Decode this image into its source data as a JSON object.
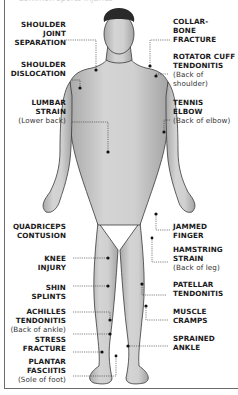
{
  "caption": "Common sports injuries",
  "colors": {
    "skin": "#c8c8c8",
    "skin_shade": "#9a9a9a",
    "hair": "#2a2a2a",
    "outline": "#3a3a3a",
    "marker": "#111111",
    "leader": "#333333",
    "frame": "#6b6b6b"
  },
  "labels": {
    "left": [
      {
        "title_lines": [
          "SHOULDER",
          "JOINT",
          "SEPARATION"
        ],
        "sub": ""
      },
      {
        "title_lines": [
          "SHOULDER",
          "DISLOCATION"
        ],
        "sub": ""
      },
      {
        "title_lines": [
          "LUMBAR",
          "STRAIN"
        ],
        "sub": "(Lower back)"
      },
      {
        "title_lines": [
          "QUADRICEPS",
          "CONTUSION"
        ],
        "sub": ""
      },
      {
        "title_lines": [
          "KNEE",
          "INJURY"
        ],
        "sub": ""
      },
      {
        "title_lines": [
          "SHIN",
          "SPLINTS"
        ],
        "sub": ""
      },
      {
        "title_lines": [
          "ACHILLES",
          "TENDONITIS"
        ],
        "sub": "(Back of ankle)"
      },
      {
        "title_lines": [
          "STRESS",
          "FRACTURE"
        ],
        "sub": ""
      },
      {
        "title_lines": [
          "PLANTAR",
          "FASCIITIS"
        ],
        "sub": "(Sole of foot)"
      }
    ],
    "right": [
      {
        "title_lines": [
          "COLLAR-",
          "BONE",
          "FRACTURE"
        ],
        "sub": ""
      },
      {
        "title_lines": [
          "ROTATOR CUFF",
          "TENDONITIS"
        ],
        "sub": "(Back of shoulder)"
      },
      {
        "title_lines": [
          "TENNIS",
          "ELBOW"
        ],
        "sub": "(Back of elbow)"
      },
      {
        "title_lines": [
          "JAMMED",
          "FINGER"
        ],
        "sub": ""
      },
      {
        "title_lines": [
          "HAMSTRING",
          "STRAIN"
        ],
        "sub": "(Back of leg)"
      },
      {
        "title_lines": [
          "PATELLAR",
          "TENDONITIS"
        ],
        "sub": ""
      },
      {
        "title_lines": [
          "MUSCLE",
          "CRAMPS"
        ],
        "sub": ""
      },
      {
        "title_lines": [
          "SPRAINED",
          "ANKLE"
        ],
        "sub": ""
      }
    ]
  }
}
